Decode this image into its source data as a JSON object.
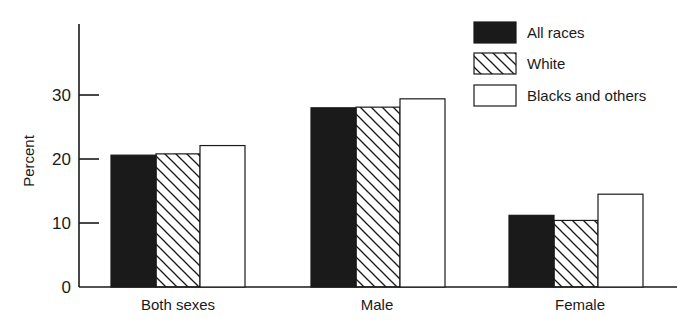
{
  "chart_data": {
    "type": "bar",
    "title": "",
    "xlabel": "",
    "ylabel": "Percent",
    "ylim": [
      0,
      40
    ],
    "yticks": [
      0,
      10,
      20,
      30
    ],
    "grid": false,
    "legend_position": "top-right",
    "categories": [
      "Both sexes",
      "Male",
      "Female"
    ],
    "series": [
      {
        "name": "All races",
        "pattern": "solid-black",
        "values": [
          20.6,
          28.0,
          11.2
        ]
      },
      {
        "name": "White",
        "pattern": "diagonal-hatch",
        "values": [
          20.8,
          28.1,
          10.4
        ]
      },
      {
        "name": "Blacks and others",
        "pattern": "white",
        "values": [
          22.1,
          29.4,
          14.5
        ]
      }
    ]
  },
  "colors": {
    "ink": "#1a1a1a",
    "background": "#ffffff"
  }
}
